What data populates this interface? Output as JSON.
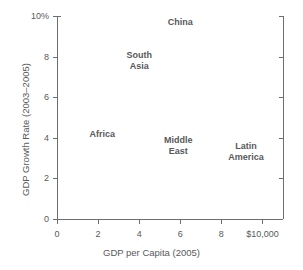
{
  "chart_data": {
    "type": "scatter",
    "title": "",
    "xlabel": "GDP per Capita (2005)",
    "ylabel": "GDP Growth Rate (2003–2005)",
    "xlim": [
      0,
      11
    ],
    "ylim": [
      0,
      10
    ],
    "grid": false,
    "legend": "none",
    "marker_style": "text-label-only",
    "xticks": [
      {
        "value": 0,
        "label": "0"
      },
      {
        "value": 2,
        "label": "2"
      },
      {
        "value": 4,
        "label": "4"
      },
      {
        "value": 6,
        "label": "6"
      },
      {
        "value": 8,
        "label": "8"
      },
      {
        "value": 10,
        "label": "$10,000"
      }
    ],
    "yticks": [
      {
        "value": 0,
        "label": "0"
      },
      {
        "value": 2,
        "label": "2"
      },
      {
        "value": 4,
        "label": "4"
      },
      {
        "value": 6,
        "label": "6"
      },
      {
        "value": 8,
        "label": "8"
      },
      {
        "value": 10,
        "label": "10%"
      }
    ],
    "points": [
      {
        "label": "China",
        "x": 6.0,
        "y": 9.7,
        "label_lines": "China"
      },
      {
        "label": "South Asia",
        "x": 4.0,
        "y": 7.8,
        "label_lines": "South\nAsia"
      },
      {
        "label": "Africa",
        "x": 2.2,
        "y": 4.2,
        "label_lines": "Africa"
      },
      {
        "label": "Middle East",
        "x": 5.9,
        "y": 3.6,
        "label_lines": "Middle\nEast"
      },
      {
        "label": "Latin America",
        "x": 9.2,
        "y": 3.3,
        "label_lines": "Latin\nAmerica"
      }
    ]
  },
  "colors": {
    "axis": "#6d6e71",
    "text": "#58595b",
    "background": "#ffffff"
  }
}
